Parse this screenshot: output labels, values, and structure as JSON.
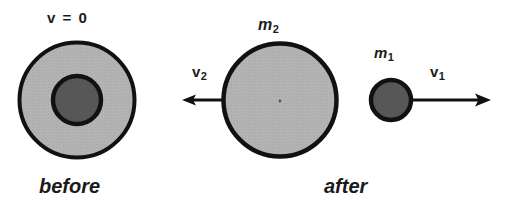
{
  "figure": {
    "width": 518,
    "height": 210,
    "background_color": "#ffffff",
    "ink_color": "#1a1a1a"
  },
  "colors": {
    "outline": "#111111",
    "light_body_fill": "#b4b4b4",
    "dark_body_fill": "#585858",
    "background": "#ffffff"
  },
  "panels": {
    "before": {
      "caption": "before",
      "velocity_label": "v = 0",
      "outer_body": {
        "name": "m2-shell",
        "cx": 77,
        "cy": 100,
        "r": 58,
        "fill": "#b4b4b4"
      },
      "inner_body": {
        "name": "m1-core",
        "cx": 77,
        "cy": 100,
        "r": 25,
        "fill": "#585858"
      }
    },
    "after_large": {
      "mass_label": "m",
      "mass_subscript": "2",
      "velocity_label": "v",
      "velocity_subscript": "2",
      "caption": "after",
      "body": {
        "name": "m2-body",
        "cx": 280,
        "cy": 100,
        "r": 57,
        "fill": "#b4b4b4"
      },
      "arrow": {
        "direction": "left",
        "from_x": 222,
        "to_x": 183,
        "y": 100
      }
    },
    "after_small": {
      "mass_label": "m",
      "mass_subscript": "1",
      "velocity_label": "v",
      "velocity_subscript": "1",
      "body": {
        "name": "m1-body",
        "cx": 391,
        "cy": 100,
        "r": 21,
        "fill": "#585858"
      },
      "arrow": {
        "direction": "right",
        "from_x": 412,
        "to_x": 490,
        "y": 100
      }
    }
  }
}
